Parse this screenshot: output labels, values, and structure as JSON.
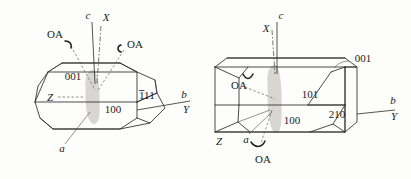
{
  "figure": {
    "background_color": "#fdfdfc",
    "line_color": "#2a2a2a",
    "shade_color": "#d4d2cf"
  },
  "crystals": [
    {
      "id": "left-crystal",
      "name": "left-crystal-elongated-prism",
      "faces": [
        {
          "name": "face-001",
          "label": "001"
        },
        {
          "name": "face-100",
          "label": "100"
        },
        {
          "name": "face-1bar11",
          "label": "111",
          "overbar_first_digit": true
        }
      ],
      "axes": [
        {
          "name": "axis-c",
          "label": "c",
          "italic": true
        },
        {
          "name": "axis-X",
          "label": "X",
          "italic": true
        },
        {
          "name": "axis-b",
          "label": "b",
          "italic": true
        },
        {
          "name": "axis-Y",
          "label": "Y",
          "italic": true
        },
        {
          "name": "axis-Z",
          "label": "Z",
          "italic": true
        },
        {
          "name": "axis-a",
          "label": "a",
          "italic": true
        }
      ],
      "optic_axes": [
        {
          "name": "optic-axis-left",
          "label": "OA"
        },
        {
          "name": "optic-axis-right",
          "label": "OA"
        }
      ]
    },
    {
      "id": "right-crystal",
      "name": "right-crystal-tabular-prism",
      "faces": [
        {
          "name": "face-001",
          "label": "001"
        },
        {
          "name": "face-101",
          "label": "101"
        },
        {
          "name": "face-210",
          "label": "210"
        },
        {
          "name": "face-100",
          "label": "100"
        }
      ],
      "axes": [
        {
          "name": "axis-c",
          "label": "c",
          "italic": true
        },
        {
          "name": "axis-X",
          "label": "X",
          "italic": true
        },
        {
          "name": "axis-b",
          "label": "b",
          "italic": true
        },
        {
          "name": "axis-Y",
          "label": "Y",
          "italic": true
        },
        {
          "name": "axis-Z",
          "label": "Z",
          "italic": true
        },
        {
          "name": "axis-a",
          "label": "a",
          "italic": true
        }
      ],
      "optic_axes": [
        {
          "name": "optic-axis-upper",
          "label": "OA"
        },
        {
          "name": "optic-axis-lower",
          "label": "OA"
        }
      ]
    }
  ]
}
